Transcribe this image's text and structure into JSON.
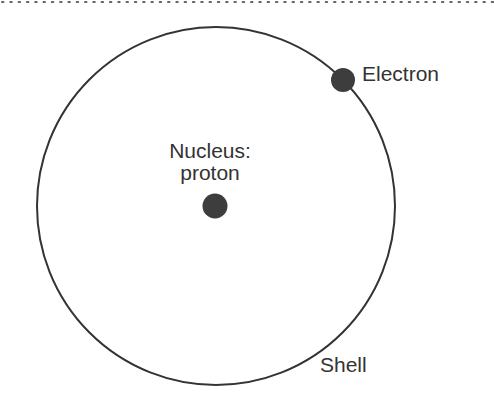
{
  "diagram": {
    "type": "atom-model",
    "labels": {
      "electron": "Electron",
      "nucleus_line1": "Nucleus:",
      "nucleus_line2": "proton",
      "shell": "Shell"
    },
    "colors": {
      "stroke": "#333333",
      "particle_fill": "#3d3d3d",
      "border_dots": "#666666",
      "background": "#ffffff"
    }
  }
}
